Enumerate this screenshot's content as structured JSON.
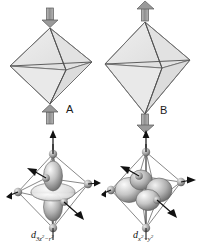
{
  "figure": {
    "background_color": "#ffffff",
    "width": 199,
    "height": 244
  },
  "palette": {
    "face_fill": "#e6e6e6",
    "face_fill_light": "#efefef",
    "edge_stroke": "#6e6e6e",
    "edge_stroke_dark": "#3c3c3c",
    "arrow_fill": "#9a9a9a",
    "arrow_stroke": "#5a5a5a",
    "atom_light": "#d8d8d8",
    "atom_mid": "#9c9c9c",
    "atom_dark": "#4a4a4a",
    "lobe_light": "#f2f2f2",
    "lobe_mid": "#b4b4b4",
    "lobe_dark": "#5e5e5e",
    "axis_line": "#1f1f1f",
    "text_color": "#111111"
  },
  "panels": {
    "octahedron_a": {
      "id": "octa-a",
      "label": "A",
      "distortion": "compression",
      "description": "Octahedron compressed along the z axis; axial arrows point inward",
      "top_arrow_direction": "down",
      "bottom_arrow_direction": "up",
      "shape": "wide flattened octahedron"
    },
    "octahedron_b": {
      "id": "octa-b",
      "label": "B",
      "distortion": "elongation",
      "description": "Octahedron elongated along the z axis; axial arrows point outward",
      "top_arrow_direction": "up",
      "bottom_arrow_direction": "down",
      "shape": "tall stretched octahedron"
    },
    "orbital_a": {
      "id": "orbital-a",
      "caption_main": "d",
      "caption_sub_pre": "3z",
      "caption_sub_exp1": "2",
      "caption_sub_mid": "−r",
      "caption_sub_exp2": "2",
      "caption_plain": "d3z2−r2",
      "description": "d orbital with two lobes along z and a torus in the xy plane, inside an octahedral ligand cage",
      "lobe_count": 2,
      "has_torus": true
    },
    "orbital_b": {
      "id": "orbital-b",
      "caption_main": "d",
      "caption_sub_pre": "x",
      "caption_sub_exp1": "2",
      "caption_sub_mid": "−y",
      "caption_sub_exp2": "2",
      "caption_plain": "dx2−y2",
      "description": "d orbital with four lobes in the xy plane pointing at the equatorial ligands",
      "lobe_count": 4,
      "has_torus": false
    }
  },
  "axes": {
    "arrow_names": [
      "x-axis-arrow",
      "y-axis-arrow",
      "z-axis-arrow"
    ],
    "count_per_orbital": 4
  }
}
